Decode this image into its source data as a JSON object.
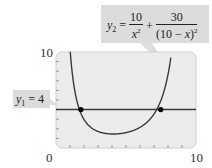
{
  "chart_data": {
    "type": "line",
    "title": "",
    "xlabel": "",
    "ylabel": "",
    "xlim": [
      0,
      10
    ],
    "ylim": [
      0,
      10
    ],
    "x_tick_labels": [
      "0",
      "10"
    ],
    "y_tick_labels": [
      "10"
    ],
    "x_minor_ticks": [
      1,
      2,
      3,
      4,
      5,
      6,
      7,
      8,
      9
    ],
    "y_minor_ticks": [
      1,
      2,
      3,
      4,
      5,
      6,
      7,
      8,
      9
    ],
    "grid": false,
    "series": [
      {
        "name": "y1 = 4",
        "equation": "y1 = 4",
        "x": [
          0,
          10
        ],
        "y": [
          4,
          4
        ]
      },
      {
        "name": "y2 = 10/x^2 + 30/(10 - x)^2",
        "equation": "y2 = 10/x^2 + 30/(10 - x)^2",
        "x": [
          1.0,
          1.5,
          2.0,
          2.5,
          3.0,
          3.5,
          4.0,
          4.5,
          5.0,
          5.5,
          6.0,
          6.5,
          7.0,
          7.5,
          8.0
        ],
        "y": [
          10.37,
          4.86,
          2.97,
          2.13,
          1.72,
          1.53,
          1.46,
          1.48,
          1.6,
          1.81,
          2.15,
          2.69,
          3.54,
          4.98,
          7.66
        ]
      }
    ],
    "intersections": [
      {
        "x": 1.78,
        "y": 4
      },
      {
        "x": 7.48,
        "y": 4
      }
    ],
    "annotations": [
      {
        "text": "y1 = 4",
        "target": "horizontal line"
      },
      {
        "text": "y2 = 10/x^2 + 30/(10 - x)^2",
        "target": "curve"
      }
    ]
  },
  "labels": {
    "x_min": "0",
    "x_max": "10",
    "y_max": "10",
    "y1_var": "y",
    "y1_sub": "1",
    "y1_rest": " = 4",
    "y2_var": "y",
    "y2_sub": "2",
    "y2_eq": " = ",
    "y2_num1": "10",
    "y2_den1_var": "x",
    "y2_den1_exp": "2",
    "y2_plus": " + ",
    "y2_num2": "30",
    "y2_den2_pre": "(10 − ",
    "y2_den2_var": "x",
    "y2_den2_post": ")",
    "y2_den2_exp": "2"
  },
  "colors": {
    "plot_bg": "#ececec",
    "plot_border": "#c8c8c8",
    "curve": "#3a3a3a",
    "line": "#3a3a3a",
    "point": "#000000",
    "callout_bg": "#dcdcdc"
  }
}
